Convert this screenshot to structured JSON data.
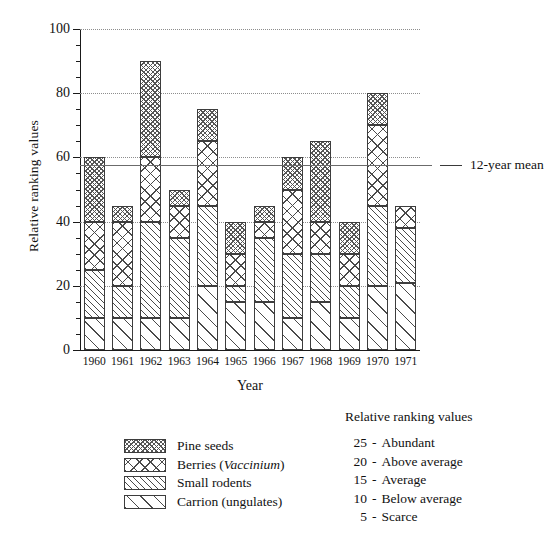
{
  "chart_data": {
    "type": "bar",
    "stacked": true,
    "title": "",
    "xlabel": "Year",
    "ylabel": "Relative ranking values",
    "ylim": [
      0,
      100
    ],
    "yticks": [
      0,
      20,
      40,
      60,
      80,
      100
    ],
    "ytick_labels": [
      "0",
      "20",
      "40",
      "60",
      "80",
      "100"
    ],
    "minor_tick_step": 5,
    "grid": "horizontal-dotted",
    "categories": [
      "1960",
      "1961",
      "1962",
      "1963",
      "1964",
      "1965",
      "1966",
      "1967",
      "1968",
      "1969",
      "1970",
      "1971"
    ],
    "series": [
      {
        "name": "Carrion (ungulates)",
        "key": "carrion",
        "values": [
          10,
          10,
          10,
          10,
          20,
          15,
          15,
          10,
          15,
          10,
          20,
          21
        ]
      },
      {
        "name": "Small rodents",
        "key": "rodents",
        "values": [
          15,
          10,
          30,
          25,
          25,
          5,
          20,
          20,
          15,
          10,
          25,
          17
        ]
      },
      {
        "name": "Berries (Vaccinium)",
        "key": "berries",
        "values": [
          15,
          20,
          20,
          10,
          20,
          10,
          5,
          20,
          10,
          10,
          25,
          7
        ]
      },
      {
        "name": "Pine seeds",
        "key": "pine",
        "values": [
          20,
          5,
          30,
          5,
          10,
          10,
          5,
          10,
          25,
          10,
          10,
          0
        ]
      }
    ],
    "totals": [
      60,
      45,
      90,
      50,
      75,
      40,
      45,
      60,
      65,
      40,
      80,
      45
    ],
    "annotations": [
      {
        "name": "12-year mean",
        "label": "12-year mean",
        "value": 57.5,
        "type": "hline"
      }
    ],
    "legend_position": "below-left"
  },
  "axis": {
    "y_label": "Relative ranking values",
    "x_label": "Year"
  },
  "mean_annotation": {
    "label": "12-year mean",
    "value": 57.5
  },
  "legend": {
    "items": [
      {
        "label": "Pine seeds",
        "pattern": "pat-pine",
        "italic_part": ""
      },
      {
        "label": "Berries (",
        "pattern": "pat-berries",
        "italic_part": "Vaccinium",
        "label_tail": ")"
      },
      {
        "label": "Small rodents",
        "pattern": "pat-rodents",
        "italic_part": ""
      },
      {
        "label": "Carrion (ungulates)",
        "pattern": "pat-carrion",
        "italic_part": ""
      }
    ]
  },
  "key": {
    "title": "Relative ranking values",
    "rows": [
      {
        "num": "25",
        "dash": "-",
        "desc": "Abundant"
      },
      {
        "num": "20",
        "dash": "-",
        "desc": "Above average"
      },
      {
        "num": "15",
        "dash": "-",
        "desc": "Average"
      },
      {
        "num": "10",
        "dash": "-",
        "desc": "Below average"
      },
      {
        "num": "5",
        "dash": "-",
        "desc": "Scarce"
      }
    ]
  },
  "colors": {
    "axis": "#1a1a1a",
    "grid": "#8d8d8d",
    "mean_line": "#6b6b6b",
    "bar_outline": "#3d3d3d",
    "background": "#ffffff"
  }
}
